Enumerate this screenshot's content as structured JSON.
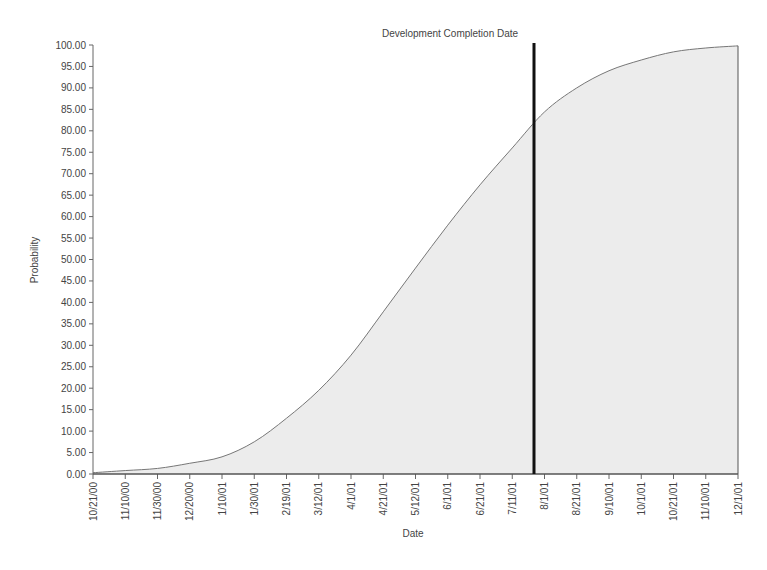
{
  "chart_data": {
    "type": "area",
    "title": "",
    "annotation": "Development Completion Date",
    "annotation_x": "7/26/01",
    "xlabel": "Date",
    "ylabel": "Probability",
    "ylim": [
      0,
      100
    ],
    "y_ticks": [
      "0.00",
      "5.00",
      "10.00",
      "15.00",
      "20.00",
      "25.00",
      "30.00",
      "35.00",
      "40.00",
      "45.00",
      "50.00",
      "55.00",
      "60.00",
      "65.00",
      "70.00",
      "75.00",
      "80.00",
      "85.00",
      "90.00",
      "95.00",
      "100.00"
    ],
    "categories": [
      "10/21/00",
      "11/10/00",
      "11/30/00",
      "12/20/00",
      "1/10/01",
      "1/30/01",
      "2/19/01",
      "3/12/01",
      "4/1/01",
      "4/21/01",
      "5/12/01",
      "6/1/01",
      "6/21/01",
      "7/11/01",
      "8/1/01",
      "8/21/01",
      "9/10/01",
      "10/1/01",
      "10/21/01",
      "11/10/01",
      "12/1/01"
    ],
    "values": [
      0.3,
      0.8,
      1.3,
      2.5,
      4.0,
      7.5,
      13.0,
      19.5,
      27.7,
      37.8,
      48.0,
      58.0,
      67.4,
      76.0,
      84.4,
      90.0,
      94.0,
      96.5,
      98.4,
      99.3,
      99.8
    ],
    "grid": false,
    "legend": "none"
  }
}
